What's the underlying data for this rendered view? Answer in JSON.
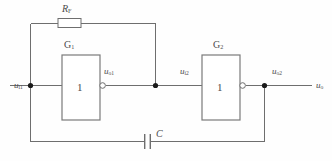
{
  "figure": {
    "name": "schmitt-trigger-rc-oscillator-schematic",
    "type": "electronic-circuit-diagram",
    "background_color": "#fefefe",
    "wire_color": "#6e6e6e",
    "label_color": "#4b4b4b",
    "node_color": "#1a1a1a",
    "width": 332,
    "height": 161
  },
  "components": {
    "resistor": {
      "name": "feedback-resistor",
      "label_main": "R",
      "label_sub": "F",
      "x": 58,
      "y": 18,
      "w": 23,
      "h": 9
    },
    "capacitor": {
      "name": "feedback-capacitor",
      "label_main": "C",
      "label_sub": "",
      "plate1_x": 144,
      "plate2_x": 150,
      "y_center": 141
    },
    "gate1": {
      "name": "inverter-gate-1",
      "label_main": "G",
      "label_sub": "1",
      "inner_symbol": "1",
      "x": 62,
      "y": 55,
      "w": 38,
      "h": 65
    },
    "gate2": {
      "name": "inverter-gate-2",
      "label_main": "G",
      "label_sub": "2",
      "inner_symbol": "1",
      "x": 202,
      "y": 55,
      "w": 38,
      "h": 65
    }
  },
  "signals": {
    "input1": {
      "main": "u",
      "sub": "i1"
    },
    "output1": {
      "main": "u",
      "sub": "o1"
    },
    "input2": {
      "main": "u",
      "sub": "i2"
    },
    "output2": {
      "main": "u",
      "sub": "o2"
    },
    "output_final": {
      "main": "u",
      "sub": "o"
    }
  },
  "nodes": [
    {
      "name": "input-node",
      "x": 30,
      "y": 85
    },
    {
      "name": "gate1-output-node",
      "x": 155,
      "y": 85
    },
    {
      "name": "gate2-output-node",
      "x": 264,
      "y": 85
    }
  ]
}
